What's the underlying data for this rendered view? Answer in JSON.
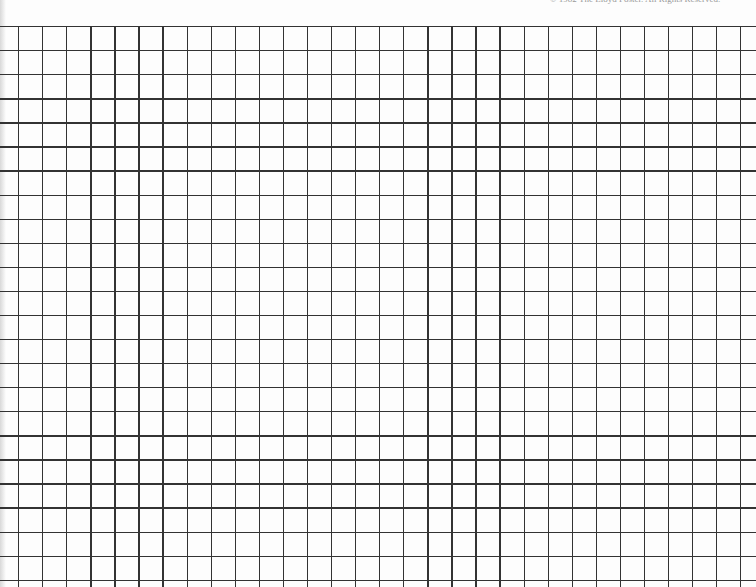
{
  "page": {
    "type": "graph paper",
    "copyright_text": "© 1982 The Lloyd Foster. All Rights Reserved.",
    "grid": {
      "origin_x": 18,
      "origin_y": 26,
      "spacing_px": 24.07,
      "vertical_lines": 31,
      "horizontal_lines": 24,
      "line_color": "#333333",
      "background_color": "#fdfdfd"
    }
  }
}
